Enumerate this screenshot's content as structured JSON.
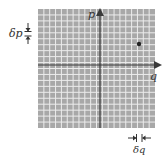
{
  "diagram": {
    "type": "phase-space-grid",
    "axes": {
      "vertical_label": "p",
      "horizontal_label": "q"
    },
    "cell_labels": {
      "height_label": "δp",
      "width_label": "δq"
    },
    "point": {
      "description": "state point in upper-right quadrant"
    },
    "grid": {
      "columns": 20,
      "rows": 20
    },
    "colors": {
      "grid_background": "#a8a8a8",
      "grid_lines": "#ececec",
      "axis": "#3a3a3a",
      "point": "#222222"
    }
  }
}
